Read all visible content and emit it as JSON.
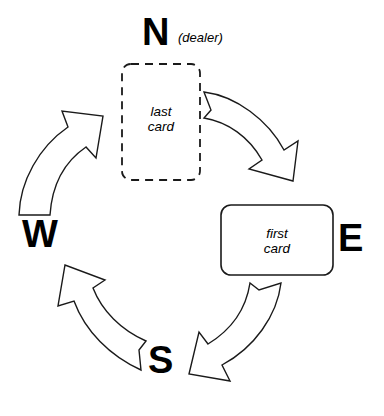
{
  "diagram": {
    "type": "cycle-diagram",
    "direction": "clockwise",
    "background_color": "#ffffff",
    "line_color": "#1a1a1a",
    "fill_color": "#ffffff"
  },
  "compass": {
    "north": "N",
    "east": "E",
    "south": "S",
    "west": "W"
  },
  "annotations": {
    "dealer": "(dealer)"
  },
  "cards": {
    "last": {
      "label": "last\ncard",
      "line1": "last",
      "line2": "card",
      "border_style": "dashed",
      "position": "north"
    },
    "first": {
      "label": "first\ncard",
      "line1": "first",
      "line2": "card",
      "border_style": "solid",
      "position": "east"
    }
  },
  "arrows": [
    {
      "name": "arrow-north-to-east",
      "from": "N",
      "to": "E"
    },
    {
      "name": "arrow-east-to-south",
      "from": "E",
      "to": "S"
    },
    {
      "name": "arrow-south-to-west",
      "from": "S",
      "to": "W"
    },
    {
      "name": "arrow-west-to-north",
      "from": "W",
      "to": "N"
    }
  ]
}
